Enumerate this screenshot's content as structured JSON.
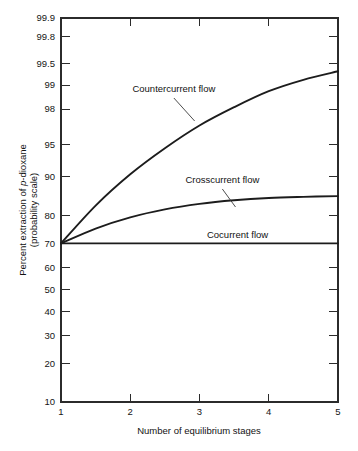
{
  "chart_data": {
    "type": "line",
    "title": "",
    "xlabel": "Number of equilibrium stages",
    "ylabel_line1": "Percent extraction of p-dioxane",
    "ylabel_line2": "(probability scale)",
    "ylabel_italic_part": "p",
    "y_scale": "probability",
    "xlim": [
      1,
      5
    ],
    "ylim": [
      10,
      99.9
    ],
    "grid": false,
    "legend_position": "inline-annotations",
    "x_ticks": [
      1,
      2,
      3,
      4,
      5
    ],
    "x_tick_labels": [
      "1",
      "2",
      "3",
      "4",
      "5"
    ],
    "y_ticks": [
      10,
      20,
      30,
      40,
      50,
      60,
      70,
      80,
      90,
      95,
      98,
      99,
      99.5,
      99.8,
      99.9
    ],
    "y_tick_labels": [
      "10",
      "20",
      "30",
      "40",
      "50",
      "60",
      "70",
      "80",
      "90",
      "95",
      "98",
      "99",
      "99.5",
      "99.8",
      "99.9"
    ],
    "x": [
      1,
      1.5,
      2,
      2.5,
      3,
      3.5,
      4,
      4.5,
      5
    ],
    "series": [
      {
        "name": "Countercurrent flow",
        "label": "Countercurrent flow",
        "values": [
          70.0,
          83.0,
          90.5,
          94.6,
          96.9,
          98.1,
          98.8,
          99.15,
          99.35
        ],
        "label_x": 2.63,
        "label_y_px": 92,
        "leader_from_x": 2.63,
        "leader_from_y_px": 98,
        "leader_to_x": 2.93,
        "leader_to_y_px": 121
      },
      {
        "name": "Crosscurrent flow",
        "label": "Crosscurrent flow",
        "values": [
          70.0,
          75.6,
          79.4,
          81.9,
          83.5,
          84.5,
          85.1,
          85.4,
          85.6
        ],
        "label_x": 3.33,
        "label_y_px": 183,
        "leader_from_x": 3.33,
        "leader_from_y_px": 189,
        "leader_to_x": 3.52,
        "leader_to_y_px": 207
      },
      {
        "name": "Cocurrent flow",
        "label": "Cocurrent flow",
        "values": [
          70.0,
          70.0,
          70.0,
          70.0,
          70.0,
          70.0,
          70.0,
          70.0,
          70.0
        ],
        "label_x": 3.55,
        "label_y_px": 238,
        "leader_from_x": null,
        "leader_from_y_px": null,
        "leader_to_x": null,
        "leader_to_y_px": null
      }
    ]
  },
  "plot_geometry": {
    "left_px": 61,
    "right_px": 338,
    "top_px": 18,
    "bottom_px": 402
  }
}
